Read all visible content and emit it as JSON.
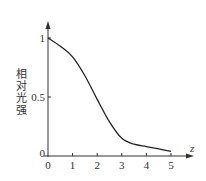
{
  "chart_data": {
    "type": "line",
    "title": "",
    "xlabel": "z",
    "ylabel": "相对光强",
    "xlim": [
      0,
      5
    ],
    "ylim": [
      0,
      1
    ],
    "xticks": [
      "0",
      "1",
      "2",
      "3",
      "4",
      "5"
    ],
    "yticks": [
      "0",
      "0.5",
      "1"
    ],
    "grid": false,
    "series": [
      {
        "name": "relative-intensity",
        "x": [
          0,
          0.5,
          1,
          1.5,
          2,
          2.5,
          3,
          3.5,
          4,
          4.5,
          5
        ],
        "values": [
          1.0,
          0.93,
          0.84,
          0.68,
          0.48,
          0.29,
          0.15,
          0.1,
          0.08,
          0.06,
          0.04
        ]
      }
    ],
    "colors": {
      "line": "#222222",
      "axis": "#333333"
    }
  }
}
